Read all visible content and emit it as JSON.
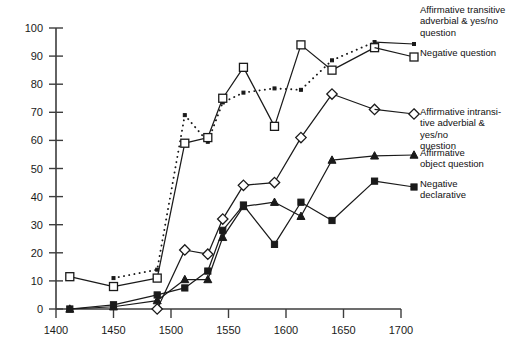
{
  "chart_data": {
    "type": "line",
    "title": "",
    "xlabel": "",
    "ylabel": "",
    "xlim": [
      1400,
      1700
    ],
    "ylim": [
      0,
      100
    ],
    "xticks": [
      1400,
      1450,
      1500,
      1550,
      1600,
      1650,
      1700
    ],
    "yticks": [
      0,
      10,
      20,
      30,
      40,
      50,
      60,
      70,
      80,
      90,
      100
    ],
    "grid": false,
    "legend_position": "right",
    "series": [
      {
        "name": "Affirmative transitive adverbial & yes/no question",
        "marker": "dot",
        "linestyle": "dotted",
        "x": [
          1450,
          1488,
          1512,
          1532,
          1545,
          1563,
          1590,
          1613,
          1640,
          1677
        ],
        "y": [
          11,
          14,
          69,
          59.5,
          73.5,
          77,
          78.5,
          78,
          88.5,
          95
        ]
      },
      {
        "name": "Negative question",
        "marker": "open-square",
        "linestyle": "solid",
        "x": [
          1412,
          1450,
          1488,
          1512,
          1532,
          1545,
          1563,
          1590,
          1613,
          1640,
          1677
        ],
        "y": [
          11.5,
          8,
          11,
          59,
          61,
          75,
          86,
          65,
          94,
          85,
          93
        ]
      },
      {
        "name": "Affirmative intransitive adverbial & yes/no question",
        "marker": "open-diamond",
        "linestyle": "solid",
        "x": [
          1488,
          1512,
          1532,
          1545,
          1563,
          1590,
          1613,
          1640,
          1677
        ],
        "y": [
          0,
          21,
          19.5,
          32,
          44,
          45,
          61,
          76.5,
          71
        ]
      },
      {
        "name": "Affirmative object question",
        "marker": "solid-triangle",
        "linestyle": "solid",
        "x": [
          1412,
          1450,
          1488,
          1512,
          1532,
          1545,
          1563,
          1590,
          1613,
          1640,
          1677
        ],
        "y": [
          0,
          0.8,
          3,
          10.5,
          10.5,
          25.5,
          36.5,
          38,
          33,
          53,
          54.5
        ]
      },
      {
        "name": "Negative declarative",
        "marker": "solid-square",
        "linestyle": "solid",
        "x": [
          1412,
          1450,
          1488,
          1512,
          1532,
          1545,
          1563,
          1590,
          1613,
          1640,
          1677
        ],
        "y": [
          0,
          1.5,
          5,
          7.5,
          13.5,
          28,
          37,
          23,
          38,
          31.5,
          45.5
        ]
      }
    ]
  },
  "legend": {
    "items": [
      {
        "label": "Affirmative transitive\nadverbial & yes/no\nquestion",
        "marker": "dot"
      },
      {
        "label": "Negative question",
        "marker": "open-square"
      },
      {
        "label": "Affirmative intransi-\ntive adverbial & yes/no\nquestion",
        "marker": "open-diamond"
      },
      {
        "label": "Affirmative\nobject question",
        "marker": "solid-triangle"
      },
      {
        "label": "Negative\ndeclarative",
        "marker": "solid-square"
      }
    ]
  },
  "colors": {
    "ink": "#1a1a1a",
    "axis": "#3d3d3d",
    "background": "#ffffff"
  }
}
